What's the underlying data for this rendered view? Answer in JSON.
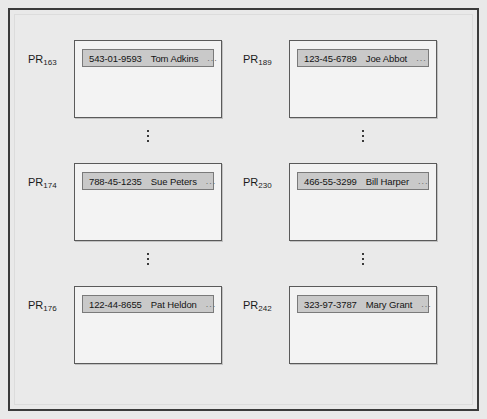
{
  "diagram": {
    "columns": [
      {
        "name": "left-column",
        "pages": [
          {
            "label_prefix": "PR",
            "label_subscript": "163",
            "record": {
              "ssn": "543-01-9593",
              "name": "Tom Adkins",
              "more": "..."
            }
          },
          {
            "label_prefix": "PR",
            "label_subscript": "174",
            "record": {
              "ssn": "788-45-1235",
              "name": "Sue Peters",
              "more": "..."
            }
          },
          {
            "label_prefix": "PR",
            "label_subscript": "176",
            "record": {
              "ssn": "122-44-8655",
              "name": "Pat Heldon",
              "more": "..."
            }
          }
        ]
      },
      {
        "name": "right-column",
        "pages": [
          {
            "label_prefix": "PR",
            "label_subscript": "189",
            "record": {
              "ssn": "123-45-6789",
              "name": "Joe Abbot",
              "more": "..."
            }
          },
          {
            "label_prefix": "PR",
            "label_subscript": "230",
            "record": {
              "ssn": "466-55-3299",
              "name": "Bill Harper",
              "more": "..."
            }
          },
          {
            "label_prefix": "PR",
            "label_subscript": "242",
            "record": {
              "ssn": "323-97-3787",
              "name": "Mary Grant",
              "more": "..."
            }
          }
        ]
      }
    ]
  },
  "colors": {
    "page_background": "#e9e9e9",
    "frame_border": "#3b3b3b",
    "page_box_fill": "#f3f3f3",
    "page_box_border": "#5a5a5a",
    "record_bar_fill": "#c9c9c9",
    "record_bar_border": "#7a7a7a",
    "text": "#141414"
  }
}
